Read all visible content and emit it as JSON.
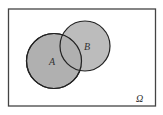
{
  "diagram": {
    "type": "venn",
    "universe": {
      "label": "Ω"
    },
    "sets": [
      {
        "label": "A"
      },
      {
        "label": "B"
      }
    ],
    "colors": {
      "fill": "#b0b0b0",
      "stroke": "#222222",
      "background": "#ffffff"
    }
  }
}
